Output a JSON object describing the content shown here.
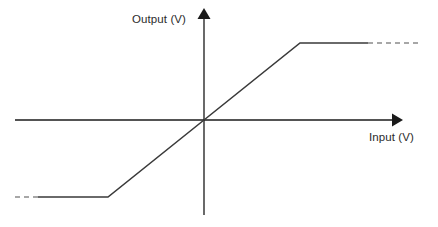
{
  "figure": {
    "background_color": "#ffffff",
    "width": 438,
    "height": 227,
    "axis_color": "#1a1a1a",
    "curve_color": "#3a3a3a",
    "dash_color": "#8a8a8a"
  },
  "labels": {
    "y_axis": "Output (V)",
    "x_axis": "Input (V)"
  },
  "chart_data": {
    "type": "line",
    "title": "",
    "xlabel": "Input (V)",
    "ylabel": "Output (V)",
    "grid": false,
    "legend": "none",
    "origin_px": [
      204,
      120
    ],
    "x_axis_px": {
      "start": [
        15,
        120
      ],
      "arrow_tip": [
        400,
        120
      ]
    },
    "y_axis_px": {
      "bottom": [
        204,
        215
      ],
      "arrow_tip": [
        204,
        11
      ]
    },
    "series": [
      {
        "name": "Transfer characteristic",
        "style": "solid",
        "points_px": [
          [
            38,
            197
          ],
          [
            108,
            197
          ],
          [
            204,
            120
          ],
          [
            300,
            43
          ],
          [
            368,
            43
          ]
        ]
      },
      {
        "name": "Negative saturation extension",
        "style": "dashed",
        "points_px": [
          [
            15,
            197
          ],
          [
            38,
            197
          ]
        ]
      },
      {
        "name": "Positive saturation extension",
        "style": "dashed",
        "points_px": [
          [
            368,
            43
          ],
          [
            420,
            43
          ]
        ]
      }
    ],
    "breakpoints": {
      "negative_knee_px": [
        108,
        197
      ],
      "origin_px": [
        204,
        120
      ],
      "positive_knee_px": [
        300,
        43
      ]
    },
    "xlim_px": [
      15,
      420
    ],
    "ylim_px": [
      215,
      11
    ]
  }
}
